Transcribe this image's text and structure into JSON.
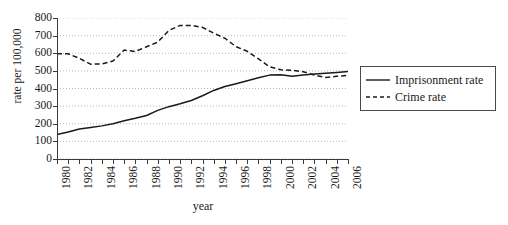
{
  "chart_data": {
    "type": "line",
    "title": "",
    "xlabel": "year",
    "ylabel": "rate per 100,000",
    "xlim": [
      1980,
      2006
    ],
    "ylim": [
      0,
      800
    ],
    "y_ticks": [
      0,
      100,
      200,
      300,
      400,
      500,
      600,
      700,
      800
    ],
    "x_ticks": [
      1980,
      1981,
      1982,
      1983,
      1984,
      1985,
      1986,
      1987,
      1988,
      1989,
      1990,
      1991,
      1992,
      1993,
      1994,
      1995,
      1996,
      1997,
      1998,
      1999,
      2000,
      2001,
      2002,
      2003,
      2004,
      2005,
      2006
    ],
    "x_tick_labels": [
      "1980",
      "",
      "1982",
      "",
      "1984",
      "",
      "1986",
      "",
      "1988",
      "",
      "1990",
      "",
      "1992",
      "",
      "1994",
      "",
      "1996",
      "",
      "1998",
      "",
      "2000",
      "",
      "2002",
      "",
      "2004",
      "",
      "2006"
    ],
    "grid": "horizontal-dotted",
    "legend_position": "right-outside",
    "x": [
      1980,
      1981,
      1982,
      1983,
      1984,
      1985,
      1986,
      1987,
      1988,
      1989,
      1990,
      1991,
      1992,
      1993,
      1994,
      1995,
      1996,
      1997,
      1998,
      1999,
      2000,
      2001,
      2002,
      2003,
      2004,
      2005,
      2006
    ],
    "series": [
      {
        "name": "Imprisonment rate",
        "style": "solid",
        "color": "#1a1a1a",
        "values": [
          139,
          153,
          170,
          179,
          188,
          200,
          217,
          231,
          247,
          276,
          297,
          313,
          332,
          359,
          389,
          411,
          427,
          444,
          461,
          476,
          478,
          470,
          476,
          482,
          486,
          491,
          497
        ]
      },
      {
        "name": "Crime rate",
        "style": "dashed",
        "color": "#1a1a1a",
        "values": [
          597,
          597,
          571,
          538,
          539,
          556,
          618,
          610,
          637,
          663,
          730,
          758,
          758,
          747,
          714,
          685,
          637,
          611,
          568,
          523,
          506,
          504,
          495,
          476,
          463,
          469,
          474
        ]
      }
    ]
  },
  "legend": {
    "items": [
      {
        "label": "Imprisonment rate",
        "style": "solid"
      },
      {
        "label": "Crime rate",
        "style": "dashed"
      }
    ]
  }
}
